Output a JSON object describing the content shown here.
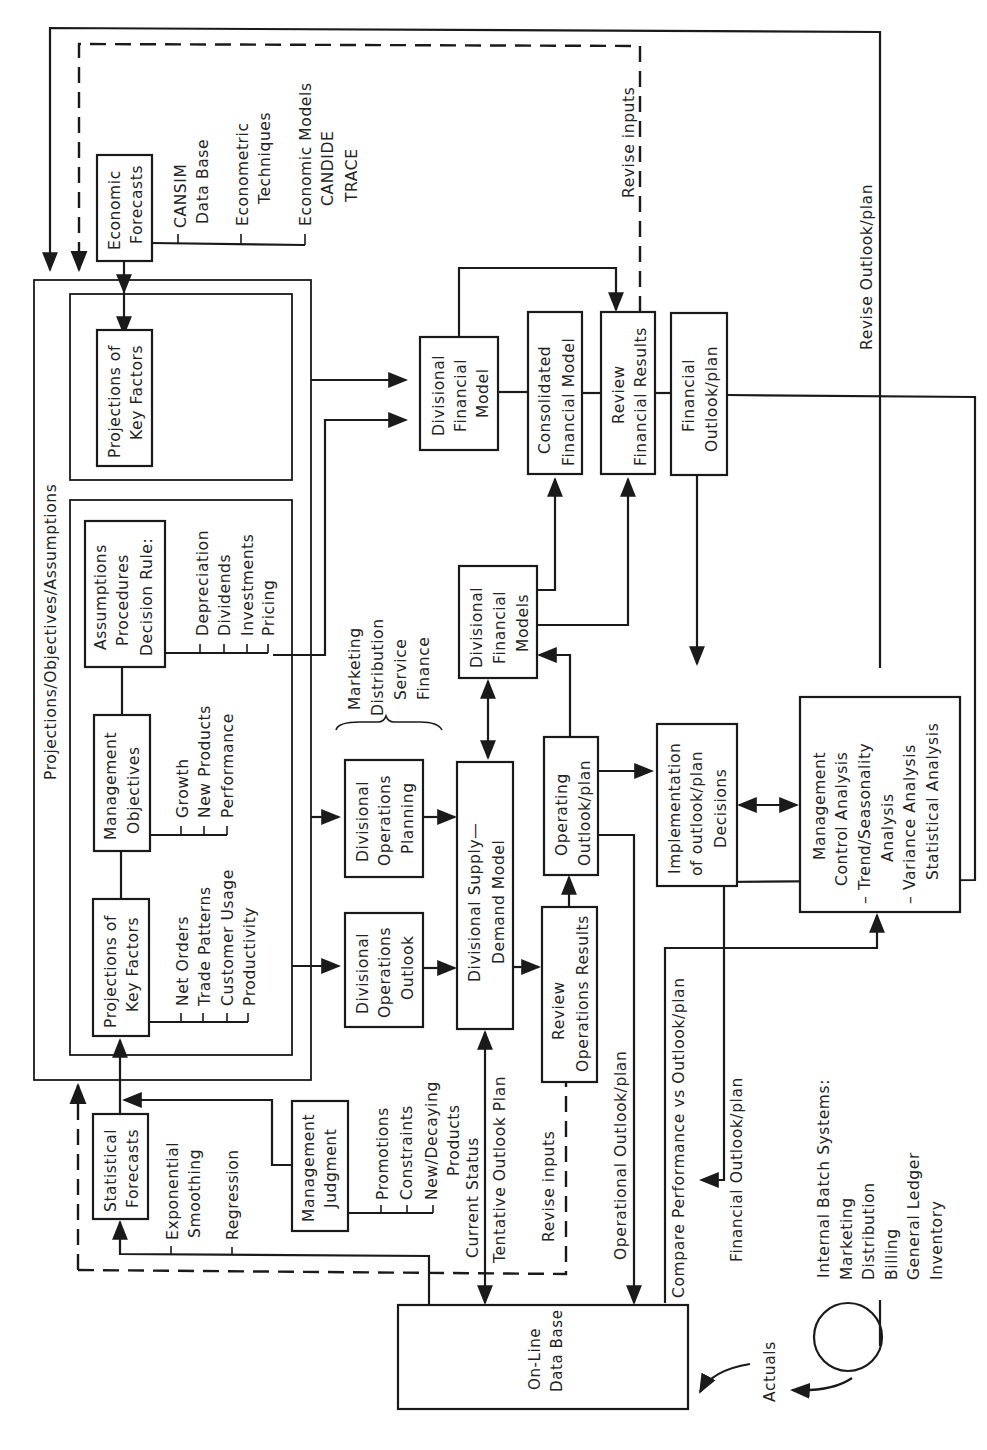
{
  "diagram": {
    "background": "#ffffff",
    "line_color": "#1a1a1a",
    "orientation": "rotated-90-ccw",
    "container": {
      "title": "Projections/Objectives/Assumptions"
    },
    "boxes": {
      "economic_forecasts": [
        "Economic",
        "Forecasts"
      ],
      "projections_key_factors_top": [
        "Projections of",
        "Key Factors"
      ],
      "assumptions": [
        "Assumptions",
        "Procedures",
        "Decision Rule:"
      ],
      "management_objectives": [
        "Management",
        "Objectives"
      ],
      "projections_key_factors_bottom": [
        "Projections of",
        "Key Factors"
      ],
      "statistical_forecasts": [
        "Statistical",
        "Forecasts"
      ],
      "management_judgment": [
        "Management",
        "Judgment"
      ],
      "divisional_financial_model": [
        "Divisional",
        "Financial",
        "Model"
      ],
      "consolidated_financial_model": [
        "Consolidated",
        "Financial Model"
      ],
      "review_financial_results": [
        "Review",
        "Financial Results"
      ],
      "financial_outlook_plan": [
        "Financial",
        "Outlook/plan"
      ],
      "divisional_financial_models": [
        "Divisional",
        "Financial",
        "Models"
      ],
      "divisional_operations_planning": [
        "Divisional",
        "Operations",
        "Planning"
      ],
      "divisional_operations_outlook": [
        "Divisional",
        "Operations",
        "Outlook"
      ],
      "divisional_supply_demand_model": [
        "Divisional Supply—",
        "Demand Model"
      ],
      "operating_outlook_plan": [
        "Operating",
        "Outlook/plan"
      ],
      "review_operations_results": [
        "Review",
        "Operations Results"
      ],
      "implementation_decisions": [
        "Implementation",
        "of outlook/plan",
        "Decisions"
      ],
      "management_control_analysis": [
        "Management",
        "Control Analysis",
        "–  Trend/Seasonality",
        "Analysis",
        "–  Variance Analysis",
        "Statistical Analysis"
      ],
      "online_data_base": [
        "On-Line",
        "Data Base"
      ]
    },
    "lists": {
      "economic_sources": [
        [
          "CANSIM",
          "Data Base"
        ],
        [
          "Econometric",
          "Techniques"
        ],
        [
          "Economic Models",
          "CANDIDE",
          "TRACE"
        ]
      ],
      "decision_rules": [
        "Depreciation",
        "Dividends",
        "Investments",
        "Pricing"
      ],
      "objectives": [
        "Growth",
        "New Products",
        "Performance"
      ],
      "key_factors": [
        "Net Orders",
        "Trade Patterns",
        "Customer Usage",
        "Productivity"
      ],
      "statistical_methods": [
        [
          "Exponential",
          "Smoothing"
        ],
        [
          "Regression"
        ]
      ],
      "judgment_items": [
        "Promotions",
        "Constraints",
        "New/Decaying",
        "Products"
      ],
      "divisional_functions": [
        "Marketing",
        "Distribution",
        "Service",
        "Finance"
      ],
      "batch_systems": [
        "Internal Batch Systems:",
        "Marketing",
        "Distribution",
        "Billing",
        "General Ledger",
        "Inventory"
      ]
    },
    "flow_labels": {
      "revise_inputs_top": "Revise inputs",
      "revise_outlook_plan": "Revise Outlook/plan",
      "current_status": "Current Status",
      "tentative_outlook_plan": "Tentative Outlook Plan",
      "revise_inputs_bottom": "Revise inputs",
      "operational_outlook_plan": "Operational Outlook/plan",
      "compare_performance": "Compare Performance vs Outlook/plan",
      "financial_outlook_plan": "Financial Outlook/plan",
      "actuals": "Actuals"
    }
  }
}
